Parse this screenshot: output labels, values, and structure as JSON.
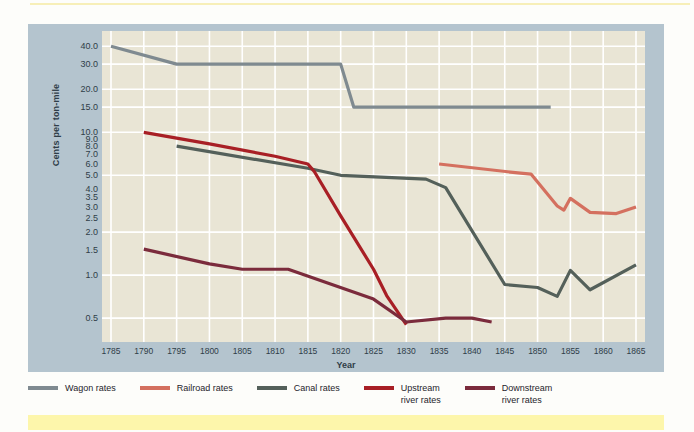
{
  "chart_data": {
    "type": "line",
    "title": "",
    "xlabel": "Year",
    "ylabel": "Cents per ton-mile",
    "xlim": [
      1785,
      1865
    ],
    "ylim": [
      0.4,
      45
    ],
    "yscale": "log",
    "grid": true,
    "legend_position": "bottom",
    "xticks": [
      1785,
      1790,
      1795,
      1800,
      1805,
      1810,
      1815,
      1820,
      1825,
      1830,
      1835,
      1840,
      1845,
      1850,
      1855,
      1860,
      1865
    ],
    "yticks": [
      "40.0",
      "30.0",
      "20.0",
      "15.0",
      "10.0",
      "9.0",
      "8.0",
      "7.0",
      "6.0",
      "5.0",
      "4.0",
      "3.5",
      "3.0",
      "2.5",
      "2.0",
      "1.5",
      "1.0",
      "0.5"
    ],
    "ytick_values": [
      40.0,
      30.0,
      20.0,
      15.0,
      10.0,
      9.0,
      8.0,
      7.0,
      6.0,
      5.0,
      4.0,
      3.5,
      3.0,
      2.5,
      2.0,
      1.5,
      1.0,
      0.5
    ],
    "gridline_values": [
      40.0,
      30.0,
      20.0,
      15.0,
      10.0,
      5.0,
      2.0,
      1.0,
      0.5
    ],
    "series": [
      {
        "name": "Wagon rates",
        "color": "#7f8a90",
        "points": [
          [
            1785,
            40.0
          ],
          [
            1795,
            30.0
          ],
          [
            1820,
            30.0
          ],
          [
            1822,
            15.0
          ],
          [
            1852,
            15.0
          ]
        ]
      },
      {
        "name": "Railroad rates",
        "color": "#d4705f",
        "points": [
          [
            1835,
            6.0
          ],
          [
            1847,
            5.2
          ],
          [
            1849,
            5.1
          ],
          [
            1853,
            3.05
          ],
          [
            1854,
            2.85
          ],
          [
            1855,
            3.45
          ],
          [
            1858,
            2.75
          ],
          [
            1862,
            2.7
          ],
          [
            1865,
            3.0
          ]
        ]
      },
      {
        "name": "Canal rates",
        "color": "#54605a",
        "points": [
          [
            1795,
            8.0
          ],
          [
            1815,
            5.6
          ],
          [
            1820,
            5.0
          ],
          [
            1833,
            4.7
          ],
          [
            1836,
            4.1
          ],
          [
            1845,
            0.86
          ],
          [
            1850,
            0.82
          ],
          [
            1853,
            0.71
          ],
          [
            1855,
            1.08
          ],
          [
            1858,
            0.79
          ],
          [
            1865,
            1.18
          ]
        ]
      },
      {
        "name": "Upstream river rates",
        "color": "#a81f25",
        "points": [
          [
            1790,
            10.0
          ],
          [
            1800,
            8.3
          ],
          [
            1810,
            6.8
          ],
          [
            1815,
            6.0
          ],
          [
            1816,
            5.3
          ],
          [
            1820,
            2.6
          ],
          [
            1825,
            1.1
          ],
          [
            1827,
            0.72
          ],
          [
            1830,
            0.45
          ]
        ]
      },
      {
        "name": "Downstream river rates",
        "color": "#7b2b3c",
        "points": [
          [
            1790,
            1.52
          ],
          [
            1800,
            1.2
          ],
          [
            1805,
            1.1
          ],
          [
            1812,
            1.1
          ],
          [
            1825,
            0.68
          ],
          [
            1830,
            0.47
          ],
          [
            1836,
            0.5
          ],
          [
            1840,
            0.5
          ],
          [
            1843,
            0.47
          ]
        ]
      }
    ]
  },
  "legend": {
    "items": [
      {
        "label_line1": "Wagon rates",
        "label_line2": "",
        "color": "#7f8a90"
      },
      {
        "label_line1": "Railroad rates",
        "label_line2": "",
        "color": "#d4705f"
      },
      {
        "label_line1": "Canal rates",
        "label_line2": "",
        "color": "#54605a"
      },
      {
        "label_line1": "Upstream",
        "label_line2": "river rates",
        "color": "#a81f25"
      },
      {
        "label_line1": "Downstream",
        "label_line2": "river rates",
        "color": "#7b2b3c"
      }
    ]
  },
  "colors": {
    "panel": "#b4c4ce",
    "plot_bg": "#e9e5d5",
    "gridline": "#ffffff",
    "axis_text": "#2f3d48",
    "top_rule": "#f7efb8",
    "bottom_band": "#fdf6ab"
  }
}
